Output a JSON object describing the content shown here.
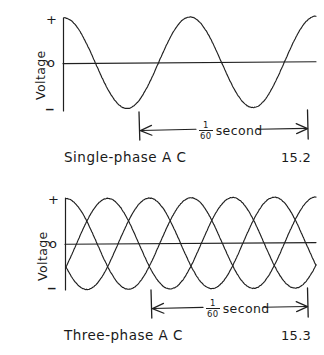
{
  "figure": {
    "background_color": "#ffffff",
    "ink_color": "#202020"
  },
  "panels": [
    {
      "id": "single-phase",
      "caption": "Single-phase A C",
      "figure_number": "15.2",
      "axis_title": "Voltage",
      "tick_labels": {
        "positive": "+",
        "zero": "o",
        "negative": "_"
      },
      "dimension": {
        "numerator": "1",
        "denominator": "60",
        "unit": "second"
      }
    },
    {
      "id": "three-phase",
      "caption": "Three-phase  A C",
      "figure_number": "15.3",
      "axis_title": "Voltage",
      "tick_labels": {
        "positive": "+",
        "zero": "o",
        "negative": "_"
      },
      "dimension": {
        "numerator": "1",
        "denominator": "60",
        "unit": "second"
      }
    }
  ],
  "chart_data": [
    {
      "type": "line",
      "id": "single-phase",
      "title": "Single-phase A C",
      "figure_number": "15.2",
      "xlabel": "",
      "ylabel": "Voltage",
      "ylim": [
        -1,
        1
      ],
      "xlim": [
        0,
        2
      ],
      "x_unit": "cycles",
      "grid": false,
      "legend": "none",
      "ytick_values": [
        1,
        0,
        -1
      ],
      "ytick_labels": [
        "+",
        "o",
        "_"
      ],
      "annotations": [
        {
          "text": "1/60 second",
          "type": "dimension",
          "spans_x": [
            0.78,
            1.78
          ],
          "meaning": "one full cycle equals one sixtieth of a second (60 Hz)"
        }
      ],
      "series": [
        {
          "name": "phase-A",
          "waveform": "cosine",
          "amplitude": 1.0,
          "phase_deg": 0,
          "cycles": 2,
          "x": [
            0,
            0.125,
            0.25,
            0.375,
            0.5,
            0.625,
            0.75,
            0.875,
            1.0,
            1.125,
            1.25,
            1.375,
            1.5,
            1.625,
            1.75,
            1.875,
            2.0
          ],
          "values": [
            1.0,
            0.707,
            0.0,
            -0.707,
            -1.0,
            -0.707,
            0.0,
            0.707,
            1.0,
            0.707,
            0.0,
            -0.707,
            -1.0,
            -0.707,
            0.0,
            0.707,
            1.0
          ]
        }
      ]
    },
    {
      "type": "line",
      "id": "three-phase",
      "title": "Three-phase  A C",
      "figure_number": "15.3",
      "xlabel": "",
      "ylabel": "Voltage",
      "ylim": [
        -1,
        1
      ],
      "xlim": [
        0,
        2
      ],
      "x_unit": "cycles",
      "grid": false,
      "legend": "none",
      "ytick_values": [
        1,
        0,
        -1
      ],
      "ytick_labels": [
        "+",
        "o",
        "_"
      ],
      "annotations": [
        {
          "text": "1/60 second",
          "type": "dimension",
          "spans_x": [
            0.84,
            1.84
          ],
          "meaning": "one full cycle equals one sixtieth of a second (60 Hz)"
        }
      ],
      "series": [
        {
          "name": "phase-A",
          "waveform": "cosine",
          "amplitude": 1.0,
          "phase_deg": 0,
          "cycles": 2,
          "x": [
            0,
            0.25,
            0.5,
            0.75,
            1.0,
            1.25,
            1.5,
            1.75,
            2.0
          ],
          "values": [
            1.0,
            0.0,
            -1.0,
            0.0,
            1.0,
            0.0,
            -1.0,
            0.0,
            1.0
          ]
        },
        {
          "name": "phase-B",
          "waveform": "cosine",
          "amplitude": 1.0,
          "phase_deg": 120,
          "cycles": 2,
          "x": [
            0,
            0.25,
            0.5,
            0.75,
            1.0,
            1.25,
            1.5,
            1.75,
            2.0
          ],
          "values": [
            -0.5,
            0.866,
            0.5,
            -0.866,
            -0.5,
            0.866,
            0.5,
            -0.866,
            -0.5
          ]
        },
        {
          "name": "phase-C",
          "waveform": "cosine",
          "amplitude": 1.0,
          "phase_deg": 240,
          "cycles": 2,
          "x": [
            0,
            0.25,
            0.5,
            0.75,
            1.0,
            1.25,
            1.5,
            1.75,
            2.0
          ],
          "values": [
            -0.5,
            -0.866,
            0.5,
            0.866,
            -0.5,
            -0.866,
            0.5,
            0.866,
            -0.5
          ]
        }
      ]
    }
  ]
}
